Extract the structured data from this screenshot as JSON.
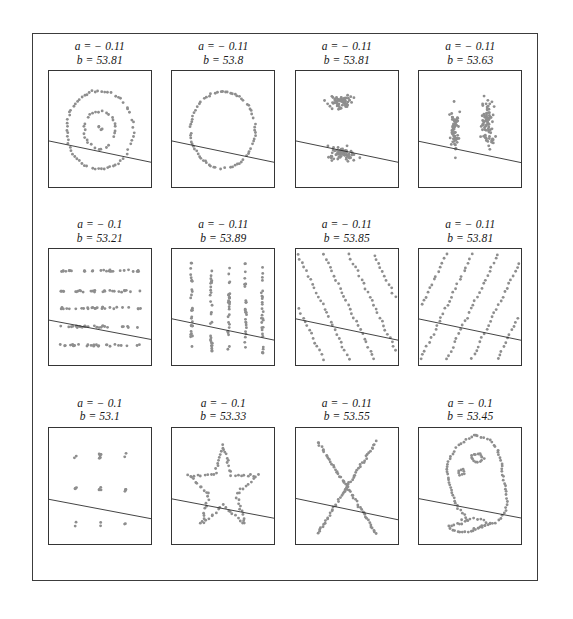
{
  "figure": {
    "title": "",
    "dot_color": "#8e8e8e",
    "line_color": "#2b2b2b",
    "frame_color": "#3c3c3c",
    "panel_border_color": "#353535",
    "background": "#ffffff",
    "rows": 3,
    "columns": 4
  },
  "panels": [
    {
      "index": 1,
      "name": "bullseye",
      "slope_label": "a = − 0.11",
      "intercept_label": "b = 53.81",
      "slope": -0.11,
      "intercept": 53.81,
      "pattern": "two concentric rings of points (bullseye)"
    },
    {
      "index": 2,
      "name": "circle",
      "slope_label": "a = − 0.11",
      "intercept_label": "b = 53.8",
      "slope": -0.11,
      "intercept": 53.8,
      "pattern": "single ring of points (circle)"
    },
    {
      "index": 3,
      "name": "two-horizontal-clusters",
      "slope_label": "a = − 0.11",
      "intercept_label": "b = 53.81",
      "slope": -0.11,
      "intercept": 53.81,
      "pattern": "two horizontal blobs, upper and lower"
    },
    {
      "index": 4,
      "name": "two-vertical-clusters",
      "slope_label": "a = − 0.11",
      "intercept_label": "b = 53.63",
      "slope": -0.11,
      "intercept": 53.63,
      "pattern": "two vertical blobs, left and right"
    },
    {
      "index": 5,
      "name": "horizontal-lines",
      "slope_label": "a = − 0.1",
      "intercept_label": "b = 53.21",
      "slope": -0.1,
      "intercept": 53.21,
      "pattern": "five horizontal bands of points"
    },
    {
      "index": 6,
      "name": "vertical-lines",
      "slope_label": "a = − 0.11",
      "intercept_label": "b = 53.89",
      "slope": -0.11,
      "intercept": 53.89,
      "pattern": "five vertical bands of points"
    },
    {
      "index": 7,
      "name": "negative-diagonal-stripes",
      "slope_label": "a = − 0.11",
      "intercept_label": "b = 53.85",
      "slope": -0.11,
      "intercept": 53.85,
      "pattern": "parallel diagonal stripes with negative slope"
    },
    {
      "index": 8,
      "name": "positive-diagonal-stripes",
      "slope_label": "a = − 0.11",
      "intercept_label": "b = 53.81",
      "slope": -0.11,
      "intercept": 53.81,
      "pattern": "parallel diagonal stripes with positive slope"
    },
    {
      "index": 9,
      "name": "dot-lattice",
      "slope_label": "a = − 0.1",
      "intercept_label": "b = 53.1",
      "slope": -0.1,
      "intercept": 53.1,
      "pattern": "sparse 3 by 3 lattice of point clumps"
    },
    {
      "index": 10,
      "name": "star",
      "slope_label": "a = − 0.1",
      "intercept_label": "b = 53.33",
      "slope": -0.1,
      "intercept": 53.33,
      "pattern": "five pointed star outline"
    },
    {
      "index": 11,
      "name": "x-shape",
      "slope_label": "a = − 0.11",
      "intercept_label": "b = 53.55",
      "slope": -0.11,
      "intercept": 53.55,
      "pattern": "two crossing diagonal arms forming an X"
    },
    {
      "index": 12,
      "name": "dinosaur",
      "slope_label": "a = − 0.1",
      "intercept_label": "b = 53.45",
      "slope": -0.1,
      "intercept": 53.45,
      "pattern": "outline of a dinosaur"
    }
  ],
  "chart_data": {
    "type": "scatter",
    "title": "",
    "xlabel": "",
    "ylabel": "",
    "xlim": [
      0,
      100
    ],
    "ylim": [
      0,
      100
    ],
    "grid": false,
    "legend": "none",
    "layout": "3 rows x 4 columns of small multiples",
    "annotations_per_panel": [
      "a = slope of fitted line",
      "b = intercept of fitted line"
    ],
    "panels": [
      {
        "name": "bullseye",
        "slope": -0.11,
        "intercept": 53.81,
        "fit_line_y_at_x0": 53.81,
        "fit_line_y_at_x100": 42.81
      },
      {
        "name": "circle",
        "slope": -0.11,
        "intercept": 53.8,
        "fit_line_y_at_x0": 53.8,
        "fit_line_y_at_x100": 42.8
      },
      {
        "name": "two-horizontal-clusters",
        "slope": -0.11,
        "intercept": 53.81,
        "fit_line_y_at_x0": 53.81,
        "fit_line_y_at_x100": 42.81
      },
      {
        "name": "two-vertical-clusters",
        "slope": -0.11,
        "intercept": 53.63,
        "fit_line_y_at_x0": 53.63,
        "fit_line_y_at_x100": 42.63
      },
      {
        "name": "horizontal-lines",
        "slope": -0.1,
        "intercept": 53.21,
        "fit_line_y_at_x0": 53.21,
        "fit_line_y_at_x100": 43.21
      },
      {
        "name": "vertical-lines",
        "slope": -0.11,
        "intercept": 53.89,
        "fit_line_y_at_x0": 53.89,
        "fit_line_y_at_x100": 42.89
      },
      {
        "name": "negative-diagonal-stripes",
        "slope": -0.11,
        "intercept": 53.85,
        "fit_line_y_at_x0": 53.85,
        "fit_line_y_at_x100": 42.85
      },
      {
        "name": "positive-diagonal-stripes",
        "slope": -0.11,
        "intercept": 53.81,
        "fit_line_y_at_x0": 53.81,
        "fit_line_y_at_x100": 42.81
      },
      {
        "name": "dot-lattice",
        "slope": -0.1,
        "intercept": 53.1,
        "fit_line_y_at_x0": 53.1,
        "fit_line_y_at_x100": 43.1
      },
      {
        "name": "star",
        "slope": -0.1,
        "intercept": 53.33,
        "fit_line_y_at_x0": 53.33,
        "fit_line_y_at_x100": 43.33
      },
      {
        "name": "x-shape",
        "slope": -0.11,
        "intercept": 53.55,
        "fit_line_y_at_x0": 53.55,
        "fit_line_y_at_x100": 42.55
      },
      {
        "name": "dinosaur",
        "slope": -0.1,
        "intercept": 53.45,
        "fit_line_y_at_x0": 53.45,
        "fit_line_y_at_x100": 43.45
      }
    ]
  }
}
